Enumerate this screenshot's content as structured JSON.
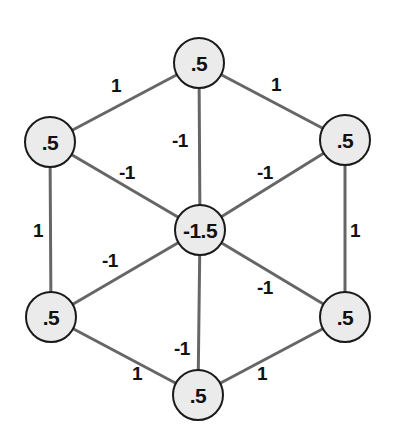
{
  "figure": {
    "type": "graph-diagram",
    "background_color": "#ffffff",
    "canvas": {
      "width": 398,
      "height": 436
    }
  },
  "style": {
    "node_fill": "#ebebeb",
    "node_stroke": "#1a1a1a",
    "edge_stroke": "#666666",
    "text_color": "#111111"
  },
  "graph": {
    "nodes": [
      {
        "id": "top",
        "label": ".5",
        "x": 199,
        "y": 63,
        "r": 25
      },
      {
        "id": "top-left",
        "label": ".5",
        "x": 50,
        "y": 142,
        "r": 25
      },
      {
        "id": "top-right",
        "label": ".5",
        "x": 345,
        "y": 140,
        "r": 25
      },
      {
        "id": "center",
        "label": "-1.5",
        "x": 200,
        "y": 230,
        "r": 25
      },
      {
        "id": "bottom-left",
        "label": ".5",
        "x": 51,
        "y": 317,
        "r": 25
      },
      {
        "id": "bottom-right",
        "label": ".5",
        "x": 345,
        "y": 317,
        "r": 25
      },
      {
        "id": "bottom",
        "label": ".5",
        "x": 198,
        "y": 395,
        "r": 25
      }
    ],
    "edges": [
      {
        "id": "e-topleft-top",
        "from": "top-left",
        "to": "top",
        "weight": "1",
        "label_x": 116,
        "label_y": 85
      },
      {
        "id": "e-top-topright",
        "from": "top",
        "to": "top-right",
        "weight": "1",
        "label_x": 276,
        "label_y": 84
      },
      {
        "id": "e-topleft-bottomleft",
        "from": "top-left",
        "to": "bottom-left",
        "weight": "1",
        "label_x": 38,
        "label_y": 230
      },
      {
        "id": "e-topright-bottomright",
        "from": "top-right",
        "to": "bottom-right",
        "weight": "1",
        "label_x": 355,
        "label_y": 230
      },
      {
        "id": "e-bottomleft-bottom",
        "from": "bottom-left",
        "to": "bottom",
        "weight": "1",
        "label_x": 137,
        "label_y": 373
      },
      {
        "id": "e-bottom-bottomright",
        "from": "bottom",
        "to": "bottom-right",
        "weight": "1",
        "label_x": 262,
        "label_y": 373
      },
      {
        "id": "e-top-center",
        "from": "top",
        "to": "center",
        "weight": "-1",
        "label_x": 180,
        "label_y": 140
      },
      {
        "id": "e-topleft-center",
        "from": "top-left",
        "to": "center",
        "weight": "-1",
        "label_x": 127,
        "label_y": 172
      },
      {
        "id": "e-topright-center",
        "from": "top-right",
        "to": "center",
        "weight": "-1",
        "label_x": 265,
        "label_y": 172
      },
      {
        "id": "e-bottomleft-center",
        "from": "bottom-left",
        "to": "center",
        "weight": "-1",
        "label_x": 110,
        "label_y": 260
      },
      {
        "id": "e-bottomright-center",
        "from": "bottom-right",
        "to": "center",
        "weight": "-1",
        "label_x": 265,
        "label_y": 287
      },
      {
        "id": "e-bottom-center",
        "from": "bottom",
        "to": "center",
        "weight": "-1",
        "label_x": 182,
        "label_y": 348
      }
    ]
  },
  "chart_data": {
    "type": "diagram",
    "title": "",
    "node_values": [
      0.5,
      0.5,
      0.5,
      -1.5,
      0.5,
      0.5,
      0.5
    ],
    "edge_values": [
      1,
      1,
      1,
      1,
      1,
      1,
      -1,
      -1,
      -1,
      -1,
      -1,
      -1
    ]
  }
}
